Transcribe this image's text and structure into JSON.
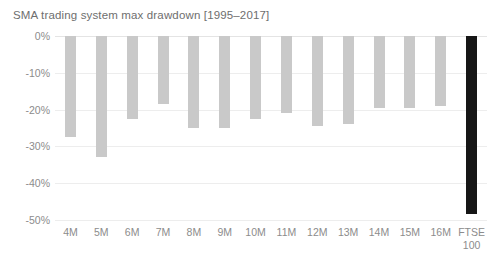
{
  "chart_data": {
    "type": "bar",
    "title": "SMA trading system max drawdown [1995–2017]",
    "xlabel": "",
    "ylabel": "",
    "categories": [
      "4M",
      "5M",
      "6M",
      "7M",
      "8M",
      "9M",
      "10M",
      "11M",
      "12M",
      "13M",
      "14M",
      "15M",
      "16M",
      "FTSE\n100"
    ],
    "values": [
      -27.5,
      -33.0,
      -22.5,
      -18.5,
      -25.0,
      -25.0,
      -22.5,
      -21.0,
      -24.5,
      -24.0,
      -19.5,
      -19.5,
      -19.0,
      -48.5
    ],
    "ylim": [
      -50,
      0
    ],
    "ytick_labels": [
      "0%",
      "-10%",
      "-20%",
      "-30%",
      "-40%",
      "-50%"
    ],
    "ytick_values": [
      0,
      -10,
      -20,
      -30,
      -40,
      -50
    ],
    "grid": true,
    "legend": "none",
    "bar_color": "#c9c9c9",
    "highlight_color": "#161616",
    "highlight_index": 13
  }
}
